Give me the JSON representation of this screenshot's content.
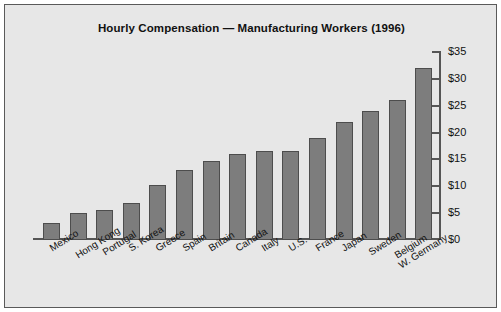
{
  "chart_data": {
    "type": "bar",
    "title": "Hourly Compensation — Manufacturing Workers (1996)",
    "xlabel": "",
    "ylabel": "",
    "ylim": [
      0,
      35
    ],
    "ytick_values": [
      0,
      5,
      10,
      15,
      20,
      25,
      30,
      35
    ],
    "ytick_labels": [
      "$0",
      "$5",
      "$10",
      "$15",
      "$20",
      "$25",
      "$30",
      "$35"
    ],
    "grid": false,
    "legend": null,
    "currency": "USD",
    "units": "dollars per hour",
    "categories": [
      "Mexico",
      "Hong Kong",
      "Portugal",
      "S. Korea",
      "Greece",
      "Spain",
      "Britain",
      "Canada",
      "Italy",
      "U.S.",
      "France",
      "Japan",
      "Sweden",
      "Belgium",
      "W. Germany"
    ],
    "values": [
      3.2,
      5.1,
      5.5,
      6.8,
      10.3,
      13.0,
      14.8,
      16.0,
      16.5,
      16.5,
      19.0,
      22.0,
      24.0,
      26.0,
      32.0
    ]
  },
  "colors": {
    "background": "#e7e7e7",
    "page": "#ffffff",
    "bar_fill": "#7d7d7d",
    "bar_edge": "#4d4d4d",
    "axis": "#555555",
    "text": "#111111",
    "frame": "#5a5a5a"
  }
}
